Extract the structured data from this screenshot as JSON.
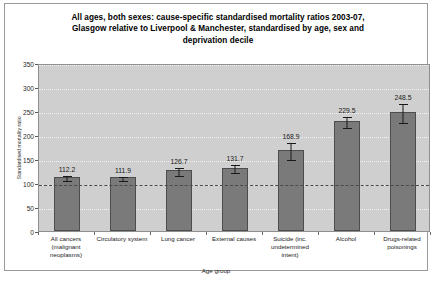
{
  "chart_data": {
    "type": "bar",
    "title": "All ages, both sexes: cause-specific standardised mortality ratios 2003-07, Glasgow relative to Liverpool & Manchester, standardised by age, sex and deprivation decile",
    "title_lines": [
      "All ages, both sexes: cause-specific standardised mortality ratios 2003-07,",
      "Glasgow relative to Liverpool & Manchester, standardised by age, sex and",
      "deprivation decile"
    ],
    "xlabel": "Age group",
    "ylabel": "Standardised mortality ratio",
    "ylim": [
      0,
      350
    ],
    "yticks": [
      0,
      50,
      100,
      150,
      200,
      250,
      300,
      350
    ],
    "grid": true,
    "legend": "none",
    "reference_line": 100,
    "categories": [
      "All cancers (malignant neoplasms)",
      "Circulatory system",
      "Lung cancer",
      "External causes",
      "Suicide (inc. undetermined intent)",
      "Alcohol",
      "Drugs-related poisonings"
    ],
    "category_lines": [
      [
        "All cancers",
        "(malignant",
        "neoplasms)"
      ],
      [
        "Circulatory system"
      ],
      [
        "Lung cancer"
      ],
      [
        "External causes"
      ],
      [
        "Suicide (inc.",
        "undetermined intent)"
      ],
      [
        "Alcohol"
      ],
      [
        "Drugs-related",
        "poisonings"
      ]
    ],
    "values": [
      112.2,
      111.9,
      126.7,
      131.7,
      168.9,
      229.5,
      248.5
    ],
    "value_labels": [
      "112.2",
      "111.9",
      "126.7",
      "131.7",
      "168.9",
      "229.5",
      "248.5"
    ],
    "error_low": [
      106.0,
      106.5,
      117.5,
      122.0,
      150.0,
      217.0,
      228.0
    ],
    "error_high": [
      118.5,
      117.5,
      136.0,
      141.5,
      188.0,
      242.0,
      269.0
    ],
    "colors": {
      "bar_fill": "#7a7a7a",
      "bar_border": "#4d4d4d",
      "plot_background": "#cfcfcf",
      "gridline": "#f2f2f2",
      "reference_line": "#4a4a4a",
      "page_background": "#ffffff"
    }
  }
}
